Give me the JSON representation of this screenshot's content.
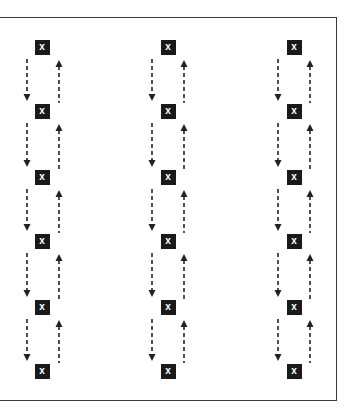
{
  "diagram": {
    "marker_label": "x",
    "colors": {
      "marker_fill": "#1a1a1a",
      "marker_text": "#ffffff",
      "arrow": "#222222",
      "frame": "#3a3a3a"
    },
    "columns": [
      {
        "id": "column-1",
        "center_x": 42,
        "down_x": 27,
        "up_x": 59
      },
      {
        "id": "column-2",
        "center_x": 168,
        "down_x": 152,
        "up_x": 184
      },
      {
        "id": "column-3",
        "center_x": 294,
        "down_x": 278,
        "up_x": 310
      }
    ],
    "rows_center_y": [
      47,
      111,
      177,
      241,
      307,
      371
    ],
    "markers": [
      [
        "x",
        "x",
        "x",
        "x",
        "x",
        "x"
      ],
      [
        "x",
        "x",
        "x",
        "x",
        "x",
        "x"
      ],
      [
        "x",
        "x",
        "x",
        "x",
        "x",
        "x"
      ]
    ]
  }
}
